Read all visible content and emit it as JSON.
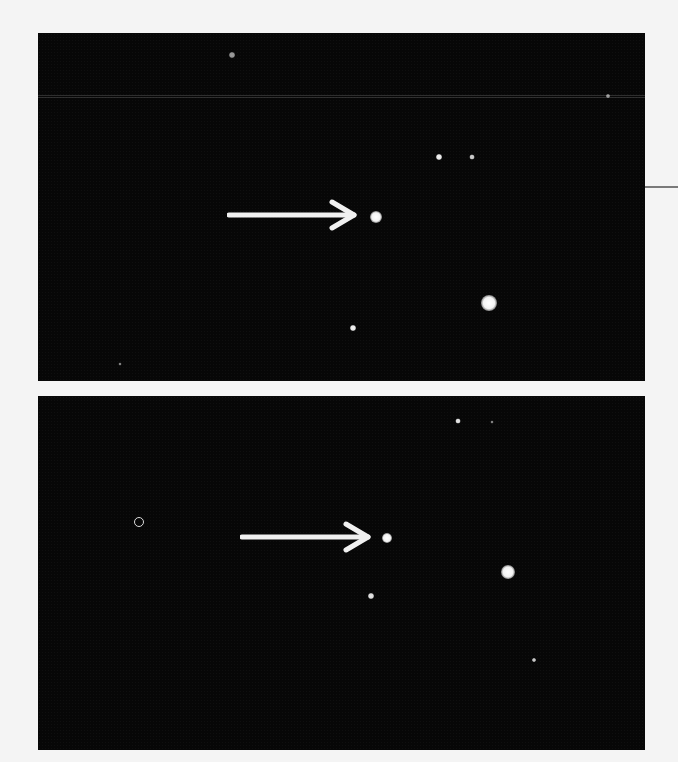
{
  "image": {
    "description": "Two astronomical photographs of a star field, each with a white arrow pointing to a star",
    "background_color": "#f4f4f4",
    "sky_color": "#070707",
    "arrow_color": "#f0f0f0"
  },
  "panels": [
    {
      "name": "top-panel",
      "box": {
        "x": 38,
        "y": 33,
        "w": 607,
        "h": 348
      },
      "arrow": {
        "x1": 227,
        "x2": 352,
        "y": 215
      },
      "target_star": {
        "x": 376,
        "y": 217,
        "r": 6
      },
      "stars": [
        {
          "x": 232,
          "y": 55,
          "r": 3,
          "opacity": 0.6
        },
        {
          "x": 608,
          "y": 96,
          "r": 2,
          "opacity": 0.6
        },
        {
          "x": 439,
          "y": 157,
          "r": 3,
          "opacity": 0.95
        },
        {
          "x": 472,
          "y": 157,
          "r": 2.5,
          "opacity": 0.8
        },
        {
          "x": 489,
          "y": 303,
          "r": 8,
          "opacity": 1
        },
        {
          "x": 353,
          "y": 328,
          "r": 3,
          "opacity": 0.95
        },
        {
          "x": 120,
          "y": 364,
          "r": 1.5,
          "opacity": 0.5
        }
      ]
    },
    {
      "name": "bottom-panel",
      "box": {
        "x": 38,
        "y": 396,
        "w": 607,
        "h": 354
      },
      "arrow": {
        "x1": 240,
        "x2": 366,
        "y": 537
      },
      "target_star": {
        "x": 387,
        "y": 538,
        "r": 5
      },
      "ring": {
        "x": 139,
        "y": 522,
        "r": 5
      },
      "stars": [
        {
          "x": 458,
          "y": 421,
          "r": 2.5,
          "opacity": 0.9
        },
        {
          "x": 492,
          "y": 422,
          "r": 1.5,
          "opacity": 0.5
        },
        {
          "x": 508,
          "y": 572,
          "r": 7,
          "opacity": 1
        },
        {
          "x": 371,
          "y": 596,
          "r": 3,
          "opacity": 0.9
        },
        {
          "x": 534,
          "y": 660,
          "r": 2,
          "opacity": 0.8
        }
      ]
    }
  ],
  "edge_line": {
    "x": 645,
    "y": 186,
    "w": 33
  }
}
